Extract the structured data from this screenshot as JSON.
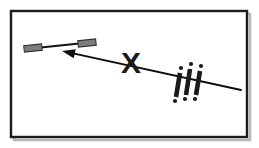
{
  "figure": {
    "title": "Warning diagram: bar object, leftward arrow, X mark and triple exclamation",
    "canvas": {
      "width": 259,
      "height": 148,
      "background": "#ffffff"
    },
    "frame": {
      "name": "outer-border-frame",
      "x": 11,
      "y": 11,
      "width": 236,
      "height": 126,
      "stroke": "#1c1c1c",
      "stroke_width": 2.4,
      "fill": "#ffffff",
      "shadow_color": "#b8b8b8"
    },
    "elements": [
      {
        "id": "bar-object",
        "label": "bar-object",
        "type": "dumbbell-bar",
        "shaft": {
          "x1": 36,
          "y1": 48,
          "x2": 84,
          "y2": 43,
          "stroke": "#111111",
          "stroke_width": 2.2
        },
        "end_blocks": [
          {
            "cx": 33,
            "cy": 48,
            "width": 18,
            "height": 6.5,
            "angle": -6,
            "fill": "#7d7d7d",
            "stroke": "#2e2e2e"
          },
          {
            "cx": 87,
            "cy": 43,
            "width": 18,
            "height": 6.5,
            "angle": -6,
            "fill": "#7d7d7d",
            "stroke": "#2e2e2e"
          }
        ]
      },
      {
        "id": "direction-arrow",
        "label": "direction-arrow",
        "type": "arrow",
        "tail": {
          "x": 241,
          "y": 90
        },
        "tip": {
          "x": 62,
          "y": 51
        },
        "stroke": "#0d0d0d",
        "stroke_width": 1.9,
        "head_length": 13,
        "head_width": 9,
        "direction": "leftward"
      },
      {
        "id": "x-mark",
        "label": "x-mark",
        "type": "glyph",
        "glyph": "X",
        "x": 131,
        "y": 62,
        "font_size": 30,
        "font_weight": "bold",
        "fill": "#1a1a1a"
      },
      {
        "id": "exclamation-marks",
        "label": "triple-exclamation",
        "type": "glyph-group",
        "glyph": "!",
        "count": 3,
        "text": "!!!",
        "fill": "#1a1a1a",
        "slant_degrees": 9,
        "strokes": [
          {
            "x1": 180,
            "y1": 73,
            "x2": 176,
            "y2": 97,
            "width": 4.6
          },
          {
            "x1": 190,
            "y1": 69,
            "x2": 186,
            "y2": 95,
            "width": 4.6
          },
          {
            "x1": 200,
            "y1": 71,
            "x2": 196,
            "y2": 95,
            "width": 4.6
          }
        ],
        "dots": [
          {
            "cx": 181,
            "cy": 68,
            "r": 2.1
          },
          {
            "cx": 191,
            "cy": 64,
            "r": 2.1
          },
          {
            "cx": 201,
            "cy": 66,
            "r": 2.1
          },
          {
            "cx": 175,
            "cy": 101,
            "r": 2.1
          },
          {
            "cx": 185,
            "cy": 99,
            "r": 2.1
          },
          {
            "cx": 195,
            "cy": 99,
            "r": 2.1
          }
        ]
      }
    ]
  }
}
